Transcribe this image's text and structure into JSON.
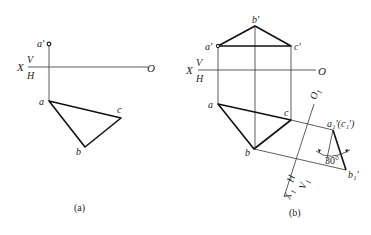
{
  "figure_a": {
    "caption": "(a)",
    "axis": {
      "x_label": "X",
      "v_label": "V",
      "h_label": "H",
      "o_label": "O"
    },
    "points": {
      "a_prime": "a'",
      "a": "a",
      "b": "b",
      "c": "c"
    }
  },
  "figure_b": {
    "caption": "(b)",
    "axis": {
      "x_label": "X",
      "v_label": "V",
      "h_label": "H",
      "o_label": "O"
    },
    "points": {
      "a_prime": "a'",
      "b_prime": "b'",
      "c_prime": "c'",
      "a": "a",
      "b": "b",
      "c": "c"
    },
    "aux_axis": {
      "o1_label": "O",
      "o1_sub": "1",
      "x1_label": "X",
      "x1_sub": "1",
      "h_label": "H",
      "v1_label": "V",
      "v1_sub": "1"
    },
    "aux_points": {
      "a1c1": "a₁'(c₁')",
      "b1": "b₁'"
    },
    "angle_label": "30°"
  },
  "colors": {
    "ink": "#222222",
    "background": "#ffffff"
  }
}
